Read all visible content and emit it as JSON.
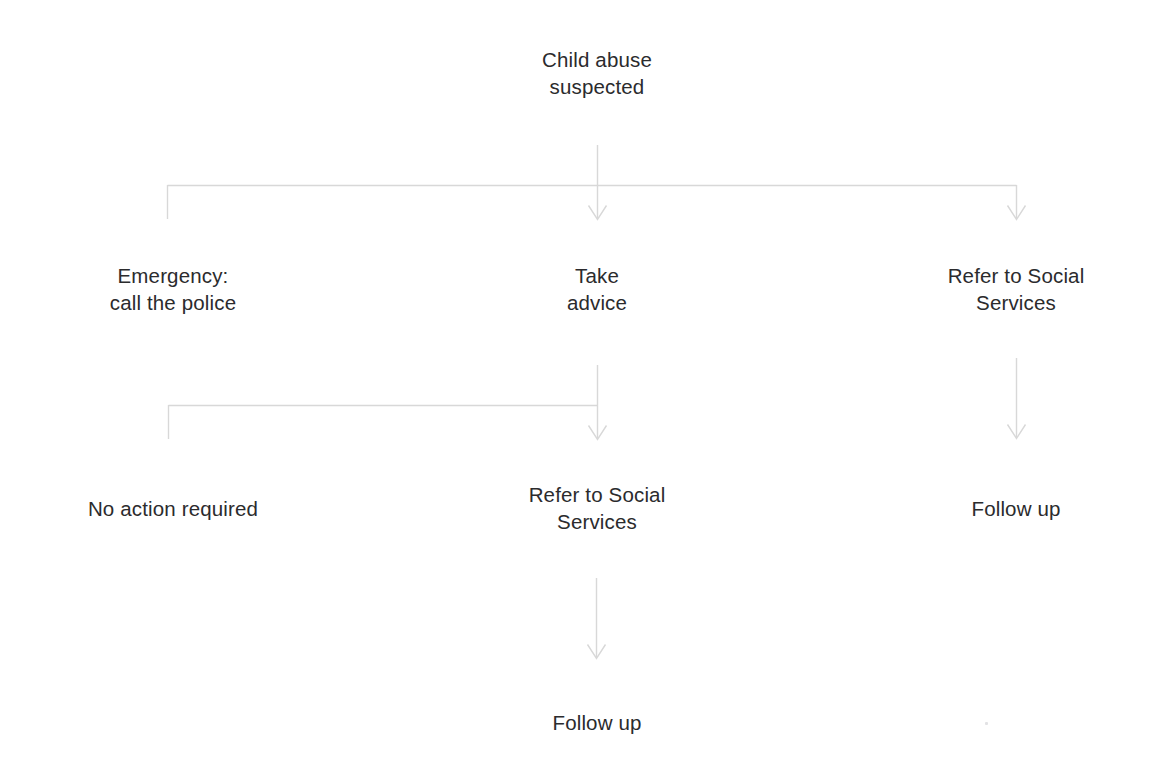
{
  "diagram": {
    "title": "Child abuse suspected",
    "background_color": "#ffffff",
    "text_color": "#2b2b2d",
    "connector_color": "#d8d8d8"
  },
  "nodes": {
    "root": {
      "label": "Child abuse\nsuspected",
      "x": 597,
      "y": 46
    },
    "emergency": {
      "label": "Emergency:\ncall the police",
      "x": 173,
      "y": 262
    },
    "take_advice": {
      "label": "Take\nadvice",
      "x": 597,
      "y": 262
    },
    "refer_social_services_top": {
      "label": "Refer to Social\nServices",
      "x": 1016,
      "y": 262
    },
    "no_action_required": {
      "label": "No action required",
      "x": 173,
      "y": 495
    },
    "refer_social_services_mid": {
      "label": "Refer to Social\nServices",
      "x": 597,
      "y": 481
    },
    "follow_up_right": {
      "label": "Follow up",
      "x": 1016,
      "y": 495
    },
    "follow_up_bottom": {
      "label": "Follow up",
      "x": 597,
      "y": 709
    }
  },
  "connectors": [
    {
      "name": "root-stem",
      "kind": "line",
      "from": "root",
      "to": "branch-bar-1",
      "arrow": false
    },
    {
      "name": "branch-bar-1",
      "kind": "horizontal-bar",
      "arrow": false
    },
    {
      "name": "branch-1-left-drop",
      "kind": "line",
      "to": "emergency",
      "arrow": false
    },
    {
      "name": "branch-1-center-arrow",
      "kind": "arrow",
      "to": "take_advice",
      "arrow": true
    },
    {
      "name": "branch-1-right-arrow",
      "kind": "arrow",
      "to": "refer_social_services_top",
      "arrow": true
    },
    {
      "name": "take-advice-stem",
      "kind": "line",
      "from": "take_advice",
      "to": "branch-bar-2",
      "arrow": false
    },
    {
      "name": "branch-bar-2",
      "kind": "horizontal-bar",
      "arrow": false
    },
    {
      "name": "branch-2-left-drop",
      "kind": "line",
      "to": "no_action_required",
      "arrow": false
    },
    {
      "name": "branch-2-center-arrow",
      "kind": "arrow",
      "to": "refer_social_services_mid",
      "arrow": true
    },
    {
      "name": "right-column-arrow",
      "kind": "arrow",
      "from": "refer_social_services_top",
      "to": "follow_up_right",
      "arrow": true
    },
    {
      "name": "center-bottom-arrow",
      "kind": "arrow",
      "from": "refer_social_services_mid",
      "to": "follow_up_bottom",
      "arrow": true
    }
  ]
}
